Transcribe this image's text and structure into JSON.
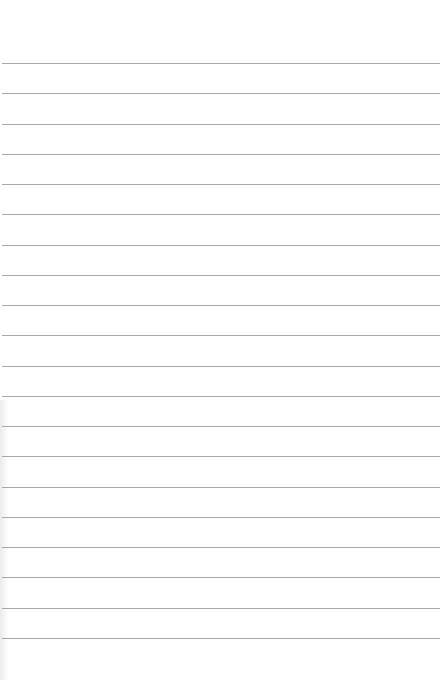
{
  "page": {
    "type": "lined-paper",
    "background_color": "#fefefe",
    "line_color": "#a8a8a8",
    "line_count": 20,
    "first_line_y": 63,
    "line_spacing": 30.25
  }
}
